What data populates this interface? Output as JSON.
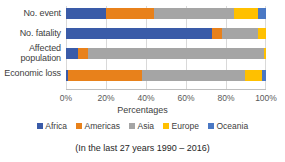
{
  "chart_data": {
    "type": "bar",
    "orientation": "horizontal",
    "stacked": true,
    "normalized": true,
    "title": "",
    "xlabel": "Percentages",
    "ylabel": "",
    "xlim": [
      0,
      100
    ],
    "xticks": [
      "0%",
      "20%",
      "40%",
      "60%",
      "80%",
      "100%"
    ],
    "xtick_values": [
      0,
      20,
      40,
      60,
      80,
      100
    ],
    "grid": true,
    "grid_axis": "x",
    "legend_position": "bottom",
    "categories": [
      "No. event",
      "No. fatality",
      "Affected population",
      "Economic loss"
    ],
    "series": [
      {
        "name": "Africa",
        "color": "#3A5BA8",
        "values": [
          20,
          73,
          6,
          1
        ]
      },
      {
        "name": "Americas",
        "color": "#E8811B",
        "values": [
          24,
          5,
          5,
          37
        ]
      },
      {
        "name": "Asia",
        "color": "#A5A5A5",
        "values": [
          40,
          18,
          88,
          51.5
        ]
      },
      {
        "name": "Europe",
        "color": "#FFC000",
        "values": [
          12,
          4,
          1,
          8.5
        ]
      },
      {
        "name": "Oceania",
        "color": "#4A78C4",
        "values": [
          4,
          0,
          0,
          2
        ]
      }
    ],
    "caption": "(In the last 27 years 1990 – 2016)"
  }
}
